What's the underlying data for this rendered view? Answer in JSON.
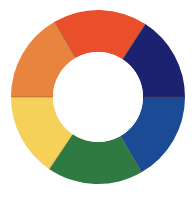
{
  "figure": {
    "name": "color-wheel",
    "background_color": "#ffffff",
    "width": 194,
    "height": 199
  },
  "chart_data": {
    "type": "pie",
    "title": "",
    "subtitle": "",
    "xlabel": "",
    "ylabel": "",
    "legend": "none",
    "grid": false,
    "donut": true,
    "center_x": 98,
    "center_y": 97,
    "outer_radius": 87,
    "inner_radius": 45,
    "inner_hole_color": "#ffffff",
    "segment_divider_color": "#6b4a2a",
    "categories": [
      "red-orange",
      "violet-blue",
      "blue",
      "green",
      "yellow",
      "orange"
    ],
    "values": [
      60,
      60,
      60,
      60,
      60,
      60
    ],
    "units": "degrees",
    "colors": [
      "#e8502a",
      "#1e2470",
      "#1a4c96",
      "#2e7a42",
      "#f5d15a",
      "#e8843c"
    ],
    "segments": [
      {
        "label": "red-orange",
        "color": "#e8502a",
        "start_angle": -30,
        "end_angle": 33,
        "value": 63
      },
      {
        "label": "violet-blue",
        "color": "#1e2470",
        "start_angle": 33,
        "end_angle": 90,
        "value": 57
      },
      {
        "label": "blue",
        "color": "#1a4c96",
        "start_angle": 90,
        "end_angle": 150,
        "value": 60
      },
      {
        "label": "green",
        "color": "#2e7a42",
        "start_angle": 150,
        "end_angle": 214,
        "value": 64
      },
      {
        "label": "yellow",
        "color": "#f5d15a",
        "start_angle": 214,
        "end_angle": 270,
        "value": 56
      },
      {
        "label": "orange",
        "color": "#e8843c",
        "start_angle": 270,
        "end_angle": 330,
        "value": 60
      }
    ]
  }
}
